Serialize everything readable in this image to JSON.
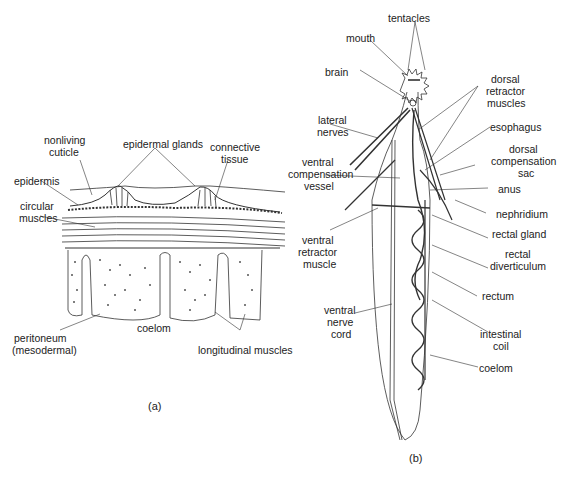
{
  "figure_a": {
    "caption": "(a)",
    "labels": {
      "epidermal_glands": "epidermal glands",
      "nonliving_cuticle_1": "nonliving",
      "nonliving_cuticle_2": "cuticle",
      "connective_tissue_1": "connective",
      "connective_tissue_2": "tissue",
      "epidermis": "epidermis",
      "circular_muscles_1": "circular",
      "circular_muscles_2": "muscles",
      "peritoneum_1": "peritoneum",
      "peritoneum_2": "(mesodermal)",
      "coelom": "coelom",
      "longitudinal_muscles": "longitudinal muscles"
    }
  },
  "figure_b": {
    "caption": "(b)",
    "labels": {
      "tentacles": "tentacles",
      "mouth": "mouth",
      "brain": "brain",
      "dorsal_retractor_1": "dorsal",
      "dorsal_retractor_2": "retractor",
      "dorsal_retractor_3": "muscles",
      "lateral_nerves_1": "lateral",
      "lateral_nerves_2": "nerves",
      "esophagus": "esophagus",
      "dorsal_comp_1": "dorsal",
      "dorsal_comp_2": "compensation",
      "dorsal_comp_3": "sac",
      "ventral_comp_1": "ventral",
      "ventral_comp_2": "compensation",
      "ventral_comp_3": "vessel",
      "anus": "anus",
      "nephridium": "nephridium",
      "ventral_retractor_1": "ventral",
      "ventral_retractor_2": "retractor",
      "ventral_retractor_3": "muscle",
      "rectal_gland": "rectal gland",
      "rectal_div_1": "rectal",
      "rectal_div_2": "diverticulum",
      "rectum": "rectum",
      "ventral_nerve_1": "ventral",
      "ventral_nerve_2": "nerve",
      "ventral_nerve_3": "cord",
      "intestinal_coil_1": "intestinal",
      "intestinal_coil_2": "coil",
      "coelom": "coelom"
    }
  }
}
